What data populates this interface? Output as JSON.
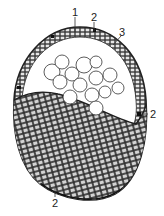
{
  "figure": {
    "type": "biological cross-section diagram",
    "labels": [
      {
        "id": "label-1",
        "text": "1",
        "x": 74,
        "y": 14
      },
      {
        "id": "label-2-top",
        "text": "2",
        "x": 92,
        "y": 19
      },
      {
        "id": "label-3",
        "text": "3",
        "x": 119,
        "y": 34
      },
      {
        "id": "label-2-right",
        "text": "2",
        "x": 150,
        "y": 118
      },
      {
        "id": "label-2-bottom",
        "text": "2",
        "x": 52,
        "y": 205
      }
    ],
    "colors": {
      "outline": "#222222",
      "cell_fill": "#bdbdbd",
      "cell_stroke": "#2a2a2a",
      "background": "#ffffff"
    }
  }
}
